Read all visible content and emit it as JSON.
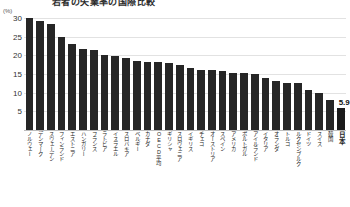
{
  "chart_data": {
    "type": "bar",
    "title": "若者の失業率の国際比較",
    "unit_label": "(%)",
    "xlabel": "",
    "ylabel": "",
    "ylim": [
      0,
      30
    ],
    "yticks": [
      30,
      25,
      20,
      15,
      10,
      5
    ],
    "grid": true,
    "legend": "none",
    "categories": [
      "ノルウェー",
      "デンマーク",
      "スウェーデン",
      "フィンランド",
      "エストニア",
      "ハンガリー",
      "フランス",
      "ラトビア",
      "イスラエル",
      "スロバキア",
      "ベルギー",
      "カナダ",
      "OECD平均",
      "ギリシャ",
      "スロヴェニア",
      "イギリス",
      "チェコ",
      "オーストリア",
      "スペイン",
      "アメリカ",
      "ポルトガル",
      "アイルランド",
      "イタリア",
      "オランダ",
      "トルコ",
      "ルクセンブルク",
      "ドイツ",
      "スイス",
      "韓国",
      "日本"
    ],
    "values": [
      30.0,
      29.2,
      28.4,
      24.9,
      23.0,
      21.8,
      21.4,
      20.1,
      19.9,
      19.4,
      18.5,
      18.3,
      18.1,
      18.0,
      17.4,
      16.5,
      16.2,
      16.1,
      15.8,
      15.4,
      15.2,
      15.0,
      13.9,
      13.2,
      12.7,
      12.5,
      10.6,
      10.0,
      8.0,
      5.9
    ],
    "highlight_category": "日本",
    "value_labels": {
      "日本": "5.9"
    }
  }
}
